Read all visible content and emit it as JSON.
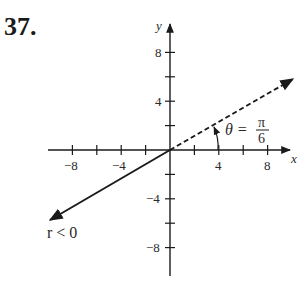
{
  "problem": {
    "number": "37."
  },
  "axes": {
    "x_label": "x",
    "y_label": "y",
    "x_ticks": [
      {
        "value": -8,
        "label": "−8"
      },
      {
        "value": -6,
        "label": ""
      },
      {
        "value": -4,
        "label": "−4"
      },
      {
        "value": -2,
        "label": ""
      },
      {
        "value": 2,
        "label": ""
      },
      {
        "value": 4,
        "label": "4"
      },
      {
        "value": 6,
        "label": ""
      },
      {
        "value": 8,
        "label": "8"
      }
    ],
    "y_ticks": [
      {
        "value": 8,
        "label": "8"
      },
      {
        "value": 6,
        "label": ""
      },
      {
        "value": 4,
        "label": "4"
      },
      {
        "value": 2,
        "label": ""
      },
      {
        "value": -2,
        "label": ""
      },
      {
        "value": -4,
        "label": "−4"
      },
      {
        "value": -6,
        "label": ""
      },
      {
        "value": -8,
        "label": "−8"
      }
    ],
    "x_tick_labels": {
      "m8": "−8",
      "m4": "−4",
      "p4": "4",
      "p8": "8"
    },
    "y_tick_labels": {
      "p8": "8",
      "p4": "4",
      "m4": "−4",
      "m8": "−8"
    }
  },
  "annotations": {
    "theta_prefix": "θ =",
    "theta_numerator": "π",
    "theta_denominator": "6",
    "r_condition": "r < 0"
  },
  "rays": [
    {
      "style": "dashed",
      "angle": "π/6",
      "direction": "first quadrant"
    },
    {
      "style": "solid",
      "angle": "7π/6",
      "direction": "third quadrant",
      "note": "r < 0"
    }
  ],
  "colors": {
    "ink": "#1a1a1a"
  }
}
